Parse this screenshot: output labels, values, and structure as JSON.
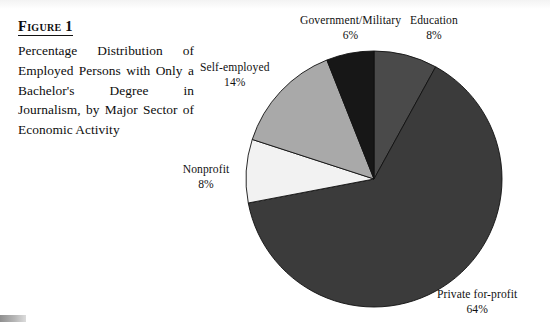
{
  "figure": {
    "label": "Figure 1",
    "caption": "Percentage Distribution of Employed Persons with Only a Bachelor's Degree in Journalism, by Major Sector of Economic Activity"
  },
  "chart_data": {
    "type": "pie",
    "title": "Percentage Distribution of Employed Persons with Only a Bachelor's Degree in Journalism, by Major Sector of Economic Activity",
    "xlabel": "",
    "ylabel": "",
    "units": "percent",
    "start_angle_deg": 0,
    "direction": "clockwise",
    "legend": "none",
    "grid": false,
    "categories": [
      "Education",
      "Private for-profit",
      "Nonprofit",
      "Self-employed",
      "Government/Military"
    ],
    "values": [
      8,
      64,
      8,
      14,
      6
    ],
    "colors": [
      "#4a4a4a",
      "#3b3b3b",
      "#f2f2f2",
      "#a9a9a9",
      "#171717"
    ],
    "slices": [
      {
        "name": "Education",
        "value": 8,
        "pct_text": "8%",
        "color": "#4a4a4a",
        "label_position": "top-right"
      },
      {
        "name": "Private for-profit",
        "value": 64,
        "pct_text": "64%",
        "color": "#3b3b3b",
        "label_position": "bottom-right"
      },
      {
        "name": "Nonprofit",
        "value": 8,
        "pct_text": "8%",
        "color": "#f2f2f2",
        "label_position": "left"
      },
      {
        "name": "Self-employed",
        "value": 14,
        "pct_text": "14%",
        "color": "#a9a9a9",
        "label_position": "top-left"
      },
      {
        "name": "Government/Military",
        "value": 6,
        "pct_text": "6%",
        "color": "#171717",
        "label_position": "top"
      }
    ]
  },
  "labels": {
    "government": {
      "name": "Government/Military",
      "pct": "6%"
    },
    "education": {
      "name": "Education",
      "pct": "8%"
    },
    "selfemployed": {
      "name": "Self-employed",
      "pct": "14%"
    },
    "nonprofit": {
      "name": "Nonprofit",
      "pct": "8%"
    },
    "private": {
      "name": "Private for-profit",
      "pct": "64%"
    }
  }
}
